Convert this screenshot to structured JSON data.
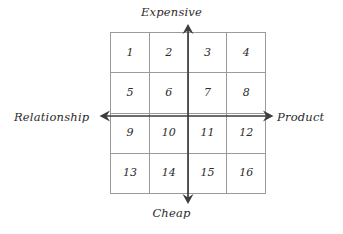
{
  "diagram": {
    "type": "2x2-style 4x4 positioning matrix",
    "axes": {
      "vertical": {
        "top_label": "Expensive",
        "bottom_label": "Cheap",
        "top_arrow_icon": "arrow-up-icon",
        "bottom_arrow_icon": "arrow-down-icon"
      },
      "horizontal": {
        "left_label": "Relationship",
        "right_label": "Product",
        "left_arrow_icon": "arrow-left-icon",
        "right_arrow_icon": "arrow-right-icon"
      }
    },
    "grid": {
      "rows": 4,
      "columns": 4,
      "cells": [
        [
          "1",
          "2",
          "3",
          "4"
        ],
        [
          "5",
          "6",
          "7",
          "8"
        ],
        [
          "9",
          "10",
          "11",
          "12"
        ],
        [
          "13",
          "14",
          "15",
          "16"
        ]
      ]
    },
    "colors": {
      "background": "#ffffff",
      "grid_line": "#9a9a9a",
      "axis_line": "#3d3d3d",
      "text": "#2b2b2b"
    }
  }
}
